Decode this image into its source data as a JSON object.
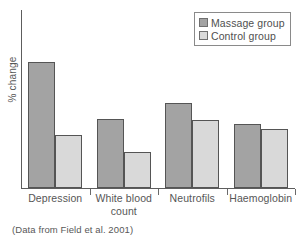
{
  "chart_data": {
    "type": "bar",
    "title": "",
    "subtitle": "",
    "xlabel": "",
    "ylabel": "% change",
    "categories": [
      "Depression",
      "White blood count",
      "Neutrofils",
      "Haemoglobin"
    ],
    "series": [
      {
        "name": "Massage group",
        "color": "#a3a3a3",
        "values": [
          71,
          39,
          48,
          36
        ]
      },
      {
        "name": "Control group",
        "color": "#d9d9d9",
        "values": [
          30,
          20,
          38,
          33
        ]
      }
    ],
    "ylim": [
      0,
      100
    ],
    "grid": false,
    "y_ticks_shown": false,
    "legend_position": "top-right",
    "annotation": "(Data from Field et al. 2001)"
  },
  "legend": {
    "items": [
      {
        "label": "Massage group",
        "swatch": "massage-swatch"
      },
      {
        "label": "Control group",
        "swatch": "control-swatch"
      }
    ]
  },
  "axis": {
    "y_label": "% change",
    "category_labels": [
      {
        "line1": "Depression",
        "line2": ""
      },
      {
        "line1": "White blood",
        "line2": "count"
      },
      {
        "line1": "Neutrofils",
        "line2": ""
      },
      {
        "line1": "Haemoglobin",
        "line2": ""
      }
    ]
  },
  "caption": {
    "text": "(Data from Field et al. 2001)"
  }
}
